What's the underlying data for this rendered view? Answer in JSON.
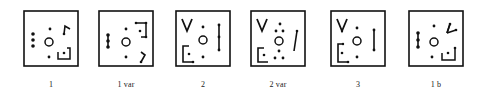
{
  "figure": {
    "panels": [
      {
        "id": "p1",
        "label": "1"
      },
      {
        "id": "p1var",
        "label": "1 var"
      },
      {
        "id": "p2",
        "label": "2"
      },
      {
        "id": "p2var",
        "label": "2 var"
      },
      {
        "id": "p3",
        "label": "3"
      },
      {
        "id": "p1b",
        "label": "1 b"
      }
    ],
    "colors": {
      "ink": "#111111",
      "background": "#ffffff"
    }
  }
}
